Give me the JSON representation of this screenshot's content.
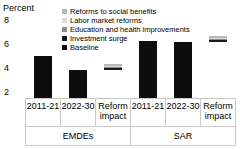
{
  "chart_data": {
    "type": "bar",
    "title": "",
    "ylabel": "Percent",
    "xlabel": "",
    "ylim": [
      2,
      8
    ],
    "yticks": [
      8,
      6,
      4,
      2
    ],
    "grid": false,
    "legend_position": "top-right",
    "categories": [
      "2011-21",
      "2022-30",
      "Reform impact",
      "2011-21",
      "2022-30",
      "Reform impact"
    ],
    "groups": [
      {
        "name": "EMDEs",
        "span": 3
      },
      {
        "name": "SAR",
        "span": 3
      }
    ],
    "legend": [
      {
        "label": "Reforms to social benefits",
        "color": "#b8b8b8"
      },
      {
        "label": "Labor market reforms",
        "color": "#dcdcdc"
      },
      {
        "label": "Education and health improvements",
        "color": "#8c8c8c"
      },
      {
        "label": "Investment surge",
        "color": "#1a1a1a"
      },
      {
        "label": "Baseline",
        "color": "#0d0d0d"
      }
    ],
    "bars": [
      {
        "category": "2011-21",
        "group": "EMDEs",
        "series": "Baseline",
        "value": 5.0,
        "color": "#0d0d0d",
        "stacked": false
      },
      {
        "category": "2022-30",
        "group": "EMDEs",
        "series": "Baseline",
        "value": 4.0,
        "color": "#0d0d0d",
        "stacked": false
      },
      {
        "category": "Reform impact",
        "group": "EMDEs",
        "series": "stack",
        "base": 4.0,
        "value": 4.35,
        "stacked": true,
        "segments": [
          {
            "series": "Reforms to social benefits",
            "value": 0.09,
            "color": "#b8b8b8"
          },
          {
            "series": "Labor market reforms",
            "value": 0.07,
            "color": "#dcdcdc"
          },
          {
            "series": "Education and health improvements",
            "value": 0.09,
            "color": "#8c8c8c"
          },
          {
            "series": "Investment surge",
            "value": 0.1,
            "color": "#1a1a1a"
          }
        ]
      },
      {
        "category": "2011-21",
        "group": "SAR",
        "series": "Baseline",
        "value": 6.1,
        "color": "#0d0d0d",
        "stacked": false
      },
      {
        "category": "2022-30",
        "group": "SAR",
        "series": "Baseline",
        "value": 6.0,
        "color": "#0d0d0d",
        "stacked": false
      },
      {
        "category": "Reform impact",
        "group": "SAR",
        "series": "stack",
        "base": 6.0,
        "value": 6.35,
        "stacked": true,
        "segments": [
          {
            "series": "Reforms to social benefits",
            "value": 0.09,
            "color": "#b8b8b8"
          },
          {
            "series": "Labor market reforms",
            "value": 0.07,
            "color": "#dcdcdc"
          },
          {
            "series": "Education and health improvements",
            "value": 0.09,
            "color": "#8c8c8c"
          },
          {
            "series": "Investment surge",
            "value": 0.1,
            "color": "#1a1a1a"
          }
        ]
      }
    ]
  },
  "axis": {
    "unit_label": "Percent",
    "tick_8": "8",
    "tick_6": "6",
    "tick_4": "4",
    "tick_2": "2"
  },
  "ticks": {
    "t0": "2011-21",
    "t1": "2022-30",
    "t2": "Reform impact",
    "t3": "2011-21",
    "t4": "2022-30",
    "t5": "Reform impact"
  },
  "groups": {
    "g0": "EMDEs",
    "g1": "SAR"
  },
  "legend": {
    "l0": "Reforms to social benefits",
    "l1": "Labor market reforms",
    "l2": "Education and health improvements",
    "l3": "Investment surge",
    "l4": "Baseline"
  }
}
